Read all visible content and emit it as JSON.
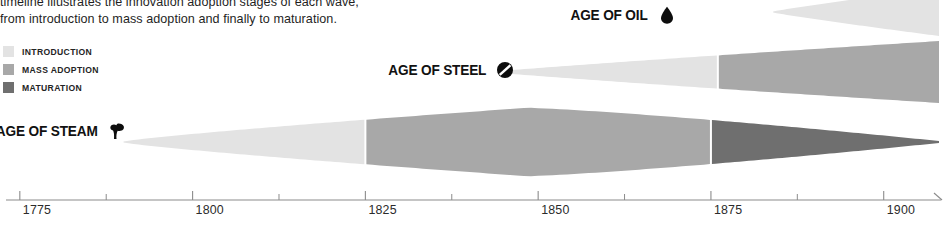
{
  "intro": {
    "line1": "timeline illustrates the innovation adoption stages of each wave,",
    "line2": "from introduction to mass adoption and finally to maturation."
  },
  "legend": {
    "items": [
      {
        "label": "INTRODUCTION",
        "color": "#e3e3e3"
      },
      {
        "label": "MASS ADOPTION",
        "color": "#a8a8a8"
      },
      {
        "label": "MATURATION",
        "color": "#6f6f6f"
      }
    ]
  },
  "waves": [
    {
      "id": "oil",
      "label": "AGE OF OIL",
      "icon": "oil-drop-icon",
      "start_year": 1884,
      "end_year": 1908,
      "phases": [
        {
          "name": "INTRODUCTION",
          "from_year": 1884,
          "to_year": 1908,
          "color": "#e3e3e3"
        }
      ]
    },
    {
      "id": "steel",
      "label": "AGE OF STEEL",
      "icon": "steel-slashed-circle-icon",
      "start_year": 1844,
      "end_year": 1908,
      "phases": [
        {
          "name": "INTRODUCTION",
          "from_year": 1844,
          "to_year": 1876,
          "color": "#e3e3e3"
        },
        {
          "name": "MASS ADOPTION",
          "from_year": 1876,
          "to_year": 1908,
          "color": "#a8a8a8"
        }
      ]
    },
    {
      "id": "steam",
      "label": "AGE OF STEAM",
      "icon": "steam-puff-icon",
      "start_year": 1790,
      "end_year": 1908,
      "phases": [
        {
          "name": "INTRODUCTION",
          "from_year": 1790,
          "to_year": 1825,
          "color": "#e3e3e3"
        },
        {
          "name": "MASS ADOPTION",
          "from_year": 1825,
          "to_year": 1875,
          "color": "#a8a8a8"
        },
        {
          "name": "MATURATION",
          "from_year": 1875,
          "to_year": 1908,
          "color": "#6f6f6f"
        }
      ]
    }
  ],
  "axis": {
    "major_ticks": [
      "1775",
      "1800",
      "1825",
      "1850",
      "1875",
      "1900"
    ],
    "major_years": [
      1775,
      1800,
      1825,
      1850,
      1875,
      1900
    ],
    "minor_years": [
      1787.5,
      1812.5,
      1837.5,
      1862.5,
      1887.5
    ],
    "range": [
      1773,
      1908
    ],
    "line_color": "#8c8c8c",
    "arrow": true
  },
  "chart_data": {
    "type": "area",
    "xlabel": "",
    "ylabel": "",
    "xlim": [
      1773,
      1908
    ],
    "grid": false,
    "legend_position": "top-left",
    "series": [
      {
        "name": "AGE OF STEAM",
        "stages": [
          {
            "stage": "INTRODUCTION",
            "start": 1790,
            "end": 1825
          },
          {
            "stage": "MASS ADOPTION",
            "start": 1825,
            "end": 1875
          },
          {
            "stage": "MATURATION",
            "start": 1875,
            "end": 1908
          }
        ]
      },
      {
        "name": "AGE OF STEEL",
        "stages": [
          {
            "stage": "INTRODUCTION",
            "start": 1844,
            "end": 1876
          },
          {
            "stage": "MASS ADOPTION",
            "start": 1876,
            "end": 1908
          }
        ]
      },
      {
        "name": "AGE OF OIL",
        "stages": [
          {
            "stage": "INTRODUCTION",
            "start": 1884,
            "end": 1908
          }
        ]
      }
    ]
  }
}
